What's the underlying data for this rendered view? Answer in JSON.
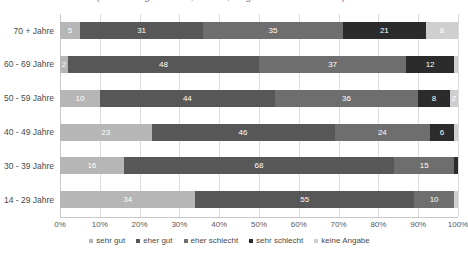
{
  "chart_data": {
    "type": "bar",
    "orientation": "horizontal",
    "stacked": true,
    "stack_mode": "percent",
    "title": "(Anwendungsbereiche, Risiken, Möglichkeiten und Nutzen) ein.",
    "xlabel": "",
    "ylabel": "",
    "xlim": [
      0,
      100
    ],
    "grid": true,
    "legend_position": "bottom",
    "tick_labels": [
      "0%",
      "10%",
      "20%",
      "30%",
      "40%",
      "50%",
      "60%",
      "70%",
      "80%",
      "90%",
      "100%"
    ],
    "tick_values": [
      0,
      10,
      20,
      30,
      40,
      50,
      60,
      70,
      80,
      90,
      100
    ],
    "categories": [
      "70 + Jahre",
      "60 - 69 Jahre",
      "50 - 59 Jahre",
      "40 - 49 Jahre",
      "30 - 39 Jahre",
      "14 - 29 Jahre"
    ],
    "series": [
      {
        "name": "sehr gut",
        "color": "#b6b6b6",
        "label_color": "#ffffff",
        "values": [
          5,
          2,
          10,
          23,
          16,
          34
        ],
        "labels": [
          "5",
          "2",
          "10",
          "23",
          "16",
          "34"
        ]
      },
      {
        "name": "eher gut",
        "color": "#575757",
        "label_color": "#ffffff",
        "values": [
          31,
          48,
          44,
          46,
          68,
          55
        ],
        "labels": [
          "31",
          "48",
          "44",
          "46",
          "68",
          "55"
        ]
      },
      {
        "name": "eher schlecht",
        "color": "#6e6e6e",
        "label_color": "#ffffff",
        "values": [
          35,
          37,
          36,
          24,
          15,
          10
        ],
        "labels": [
          "35",
          "37",
          "36",
          "24",
          "15",
          "10"
        ]
      },
      {
        "name": "sehr schlecht",
        "color": "#2b2b2b",
        "label_color": "#ffffff",
        "values": [
          21,
          12,
          8,
          6,
          1,
          0
        ],
        "labels": [
          "21",
          "12",
          "8",
          "6",
          "",
          ""
        ]
      },
      {
        "name": "keine Angabe",
        "color": "#cfcfcf",
        "label_color": "#ffffff",
        "values": [
          8,
          1,
          2,
          1,
          0,
          1
        ],
        "labels": [
          "8",
          "",
          "2",
          "",
          "",
          ""
        ]
      }
    ]
  }
}
